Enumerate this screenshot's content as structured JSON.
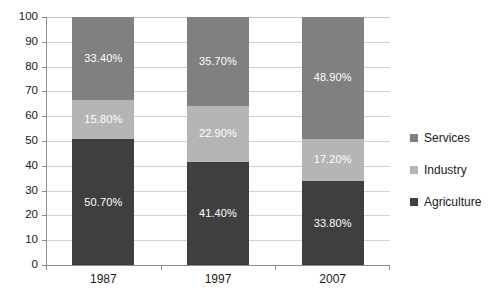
{
  "chart_data": {
    "type": "bar",
    "subtype": "stacked-bar-100",
    "title": "",
    "xlabel": "",
    "ylabel": "",
    "categories": [
      "1987",
      "1997",
      "2007"
    ],
    "ylim": [
      0,
      100
    ],
    "yticks": [
      0,
      10,
      20,
      30,
      40,
      50,
      60,
      70,
      80,
      90,
      100
    ],
    "ytick_labels": [
      "0",
      "10",
      "20",
      "30",
      "40",
      "50",
      "60",
      "70",
      "80",
      "90",
      "100"
    ],
    "grid": true,
    "legend_position": "right",
    "series": [
      {
        "name": "Services",
        "color": "#808080",
        "values": [
          33.4,
          35.7,
          48.9
        ],
        "labels": [
          "33.40%",
          "35.70%",
          "48.90%"
        ]
      },
      {
        "name": "Industry",
        "color": "#b5b5b5",
        "values": [
          15.8,
          22.9,
          17.2
        ],
        "labels": [
          "15.80%",
          "22.90%",
          "17.20%"
        ]
      },
      {
        "name": "Agriculture",
        "color": "#3f3f3f",
        "values": [
          50.7,
          41.4,
          33.8
        ],
        "labels": [
          "50.70%",
          "41.40%",
          "33.80%"
        ]
      }
    ]
  },
  "legend": {
    "items": [
      {
        "label": "Services",
        "color": "#808080"
      },
      {
        "label": "Industry",
        "color": "#b5b5b5"
      },
      {
        "label": "Agriculture",
        "color": "#3f3f3f"
      }
    ]
  },
  "axis": {
    "y_labels": [
      "100",
      "90",
      "80",
      "70",
      "60",
      "50",
      "40",
      "30",
      "20",
      "10",
      "0"
    ],
    "x_labels": [
      "1987",
      "1997",
      "2007"
    ]
  },
  "colors": {
    "services": "#808080",
    "industry": "#b5b5b5",
    "agriculture": "#3f3f3f",
    "gridline": "#d2d2d2",
    "axis": "#8c8c8c",
    "text": "#1a1a1a",
    "bar_label": "#ffffff",
    "background": "#ffffff"
  }
}
